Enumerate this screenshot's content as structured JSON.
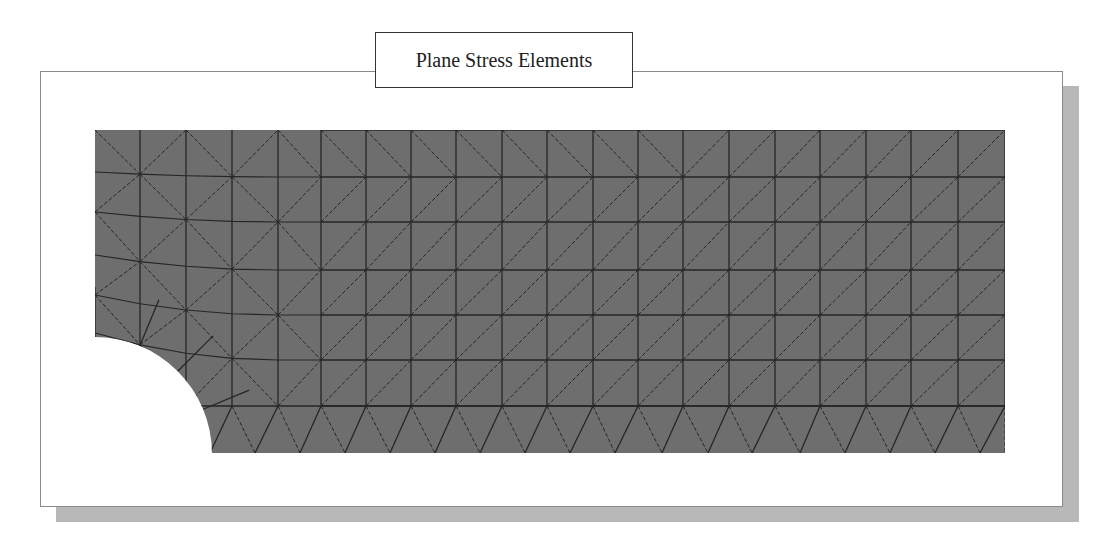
{
  "title": "Plane Stress Elements",
  "colors": {
    "mesh_fill": "#6e6e6e",
    "mesh_line": "#262626",
    "frame_border": "#8a8a8a",
    "shadow": "#b8b8b8",
    "title_border": "#333333"
  },
  "layout": {
    "frame": {
      "x": 40,
      "y": 71,
      "w": 1023,
      "h": 436
    },
    "shadow": {
      "dx": 16,
      "dy": 15
    },
    "title_box": {
      "x": 375,
      "y": 32,
      "w": 258,
      "h": 56,
      "font_size": 20
    },
    "mesh": {
      "x0": 95,
      "y0": 130,
      "x1": 1005,
      "y1": 453
    },
    "hole": {
      "cx": 95,
      "cy": 454,
      "r": 117
    }
  },
  "mesh_grid": {
    "structured_columns_x": [
      321,
      366,
      411,
      456,
      502,
      547,
      593,
      638,
      683,
      729,
      775,
      820,
      866,
      911,
      958,
      1005
    ],
    "rows_y": [
      130,
      177,
      222,
      270,
      315,
      360,
      406,
      453
    ],
    "top_row_backslash_until_x": 683,
    "left_edge_nodes_y": [
      130,
      172,
      212,
      255,
      295,
      333
    ],
    "left_columns_x": [
      95,
      140,
      186,
      232,
      278
    ],
    "bottom_row_top_nodes_x": [
      232,
      278,
      321,
      366,
      411,
      456,
      502,
      547,
      593,
      638,
      683,
      729,
      775,
      820,
      866,
      911,
      958,
      1005
    ],
    "bottom_row_bottom_nodes_x": [
      210,
      255,
      300,
      345,
      390,
      435,
      480,
      525,
      570,
      615,
      662,
      708,
      752,
      800,
      845,
      890,
      935,
      980,
      1005
    ]
  }
}
